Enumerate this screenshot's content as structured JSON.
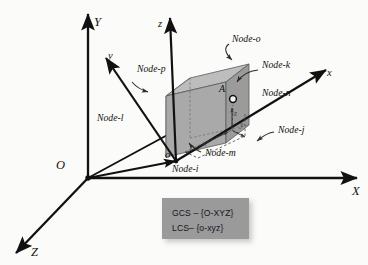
{
  "figure": {
    "type": "3d-coordinate-system-diagram",
    "background_color": "#fbfbf9",
    "line_color": "#111111"
  },
  "global_axes": {
    "origin_label": "O",
    "x_label": "X",
    "y_label": "Y",
    "z_label": "Z"
  },
  "local_axes": {
    "origin_label": "o",
    "x_label": "x",
    "y_label": "y",
    "z_label": "z"
  },
  "point": {
    "label": "A",
    "local_coord_labels": {
      "x": "x",
      "y": "y",
      "z": "z"
    }
  },
  "nodes": [
    {
      "id": "i",
      "label": "Node-i"
    },
    {
      "id": "j",
      "label": "Node-j"
    },
    {
      "id": "k",
      "label": "Node-k"
    },
    {
      "id": "l",
      "label": "Node-l"
    },
    {
      "id": "m",
      "label": "Node-m"
    },
    {
      "id": "n",
      "label": "Node-n"
    },
    {
      "id": "o",
      "label": "Node-o"
    },
    {
      "id": "p",
      "label": "Node-p"
    }
  ],
  "legend": {
    "background_color": "#9a9a9a",
    "lines": [
      {
        "system": "GCS",
        "dash": "–",
        "frame": "{O-XYZ}"
      },
      {
        "system": "LCS",
        "dash": "–",
        "frame": "{o-xyz}"
      }
    ],
    "line_1_text": "GCS – {O-XYZ}",
    "line_2_text": "LCS– {o-xyz}"
  },
  "solid": {
    "description": "hexahedral brick element",
    "top_face_color": "#b8b8b8",
    "front_face_color": "#a8a8a8",
    "left_face_color": "#8e8e8e",
    "edge_color": "#4a4a4a"
  }
}
